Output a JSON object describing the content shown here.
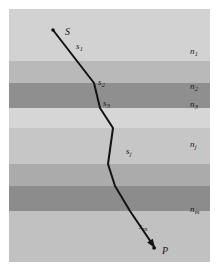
{
  "figure": {
    "kind": "ray-path-through-layered-media-diagram",
    "frame": {
      "x": 9,
      "y": 9,
      "width": 201,
      "height": 253,
      "background_color": "#c9c9c9"
    },
    "layers": [
      {
        "name": "n1",
        "label": "n",
        "subscript": "1",
        "top": 0,
        "height": 52,
        "color": "#d2d2d2"
      },
      {
        "name": "n2",
        "label": "n",
        "subscript": "2",
        "top": 52,
        "height": 22,
        "color": "#b9b9b9"
      },
      {
        "name": "n3",
        "label": "n",
        "subscript": "3",
        "top": 74,
        "height": 25,
        "color": "#8f8f8f"
      },
      {
        "name": "gap1",
        "label": "",
        "subscript": "",
        "top": 99,
        "height": 20,
        "color": "#d6d6d6"
      },
      {
        "name": "nj",
        "label": "n",
        "subscript": "j",
        "top": 119,
        "height": 36,
        "color": "#c6c6c6"
      },
      {
        "name": "mid1",
        "label": "",
        "subscript": "",
        "top": 155,
        "height": 22,
        "color": "#ababab"
      },
      {
        "name": "mid2",
        "label": "",
        "subscript": "",
        "top": 177,
        "height": 25,
        "color": "#8c8c8c"
      },
      {
        "name": "nm",
        "label": "n",
        "subscript": "m",
        "top": 202,
        "height": 51,
        "color": "#c1c1c1"
      }
    ],
    "medium_labels": [
      {
        "name": "label-n1",
        "text": "n",
        "sub": "1",
        "x": 181,
        "y": 38
      },
      {
        "name": "label-n2",
        "text": "n",
        "sub": "2",
        "x": 181,
        "y": 73
      },
      {
        "name": "label-n3",
        "text": "n",
        "sub": "3",
        "x": 181,
        "y": 91
      },
      {
        "name": "label-nj",
        "text": "n",
        "sub": "j",
        "x": 181,
        "y": 131
      },
      {
        "name": "label-nm",
        "text": "n",
        "sub": "m",
        "x": 181,
        "y": 196
      }
    ],
    "segment_labels": [
      {
        "name": "label-s1",
        "text": "s",
        "sub": "1",
        "x": 67,
        "y": 33
      },
      {
        "name": "label-s2",
        "text": "s",
        "sub": "2",
        "x": 89,
        "y": 69
      },
      {
        "name": "label-s3",
        "text": "s",
        "sub": "3",
        "x": 94,
        "y": 90
      },
      {
        "name": "label-sj",
        "text": "s",
        "sub": "j",
        "x": 117,
        "y": 138
      },
      {
        "name": "label-sm",
        "text": "s",
        "sub": "m",
        "x": 130,
        "y": 213
      }
    ],
    "points": [
      {
        "name": "point-S",
        "text": "S",
        "x": 56,
        "y": 18,
        "dot_x": 44,
        "dot_y": 21
      },
      {
        "name": "point-P",
        "text": "P",
        "x": 153,
        "y": 237,
        "dot_x": 145,
        "dot_y": 239
      }
    ],
    "ray": {
      "stroke_color": "#131313",
      "stroke_width": 2.0,
      "vertices": [
        [
          44,
          21
        ],
        [
          78,
          65
        ],
        [
          85,
          74
        ],
        [
          91,
          99
        ],
        [
          104,
          119
        ],
        [
          99,
          155
        ],
        [
          106,
          177
        ],
        [
          121,
          202
        ],
        [
          146,
          239
        ]
      ],
      "arrowhead_at": "P"
    }
  }
}
